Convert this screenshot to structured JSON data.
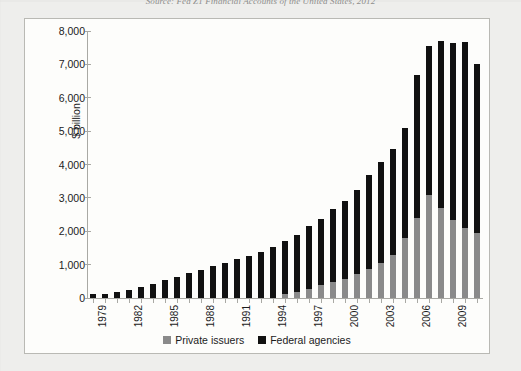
{
  "source_caption": "Source: Fed Z1 Financial Accounts of the United States, 2012",
  "colors": {
    "private_issuers": "#8a8a8a",
    "federal_agencies": "#111111",
    "axis": "#a9a9a4",
    "frame": "#b9b9b4",
    "plot_bg": "#fdfdfb",
    "page_bg": "#eeeeec"
  },
  "legend": {
    "position": "bottom-center",
    "items": [
      {
        "label": "Private issuers",
        "color": "#8a8a8a"
      },
      {
        "label": "Federal agencies",
        "color": "#111111"
      }
    ]
  },
  "axes": {
    "y_title": "$ billion",
    "y_ticks": [
      "0",
      "1,000",
      "2,000",
      "3,000",
      "4,000",
      "5,000",
      "6,000",
      "7,000",
      "8,000"
    ],
    "x_tick_labels": [
      "1979",
      "1982",
      "1985",
      "1988",
      "1991",
      "1994",
      "1997",
      "2000",
      "2003",
      "2006",
      "2009"
    ]
  },
  "chart_data": {
    "type": "bar",
    "stacked": true,
    "title": "",
    "subtitle": "",
    "xlabel": "",
    "ylabel": "$ billion",
    "ylim": [
      0,
      8000
    ],
    "ytick_step": 1000,
    "grid": false,
    "legend_position": "bottom-center",
    "categories": [
      "1979",
      "1980",
      "1981",
      "1982",
      "1983",
      "1984",
      "1985",
      "1986",
      "1987",
      "1988",
      "1989",
      "1990",
      "1991",
      "1992",
      "1993",
      "1994",
      "1995",
      "1996",
      "1997",
      "1998",
      "1999",
      "2000",
      "2001",
      "2002",
      "2003",
      "2004",
      "2005",
      "2006",
      "2007",
      "2008",
      "2009",
      "2010",
      "2011"
    ],
    "series": [
      {
        "name": "Private issuers",
        "color": "#8a8a8a",
        "values": [
          0,
          0,
          0,
          0,
          0,
          0,
          0,
          0,
          0,
          0,
          0,
          0,
          0,
          0,
          0,
          0,
          120,
          180,
          280,
          380,
          480,
          580,
          720,
          880,
          1050,
          1300,
          1800,
          2400,
          3100,
          2700,
          2350,
          2100,
          1950
        ]
      },
      {
        "name": "Federal agencies",
        "color": "#111111",
        "values": [
          110,
          130,
          180,
          250,
          320,
          420,
          540,
          640,
          740,
          840,
          950,
          1060,
          1160,
          1260,
          1390,
          1520,
          1580,
          1720,
          1890,
          2000,
          2180,
          2320,
          2530,
          2820,
          3030,
          3180,
          3300,
          4270,
          4450,
          4990,
          5300,
          5580,
          5050
        ]
      }
    ],
    "totals": [
      110,
      130,
      180,
      250,
      320,
      420,
      540,
      640,
      740,
      840,
      950,
      1060,
      1160,
      1260,
      1390,
      1520,
      1700,
      1900,
      2170,
      2380,
      2660,
      2900,
      3250,
      3700,
      4080,
      4480,
      5100,
      6670,
      7550,
      7690,
      7650,
      7680,
      7000
    ]
  }
}
